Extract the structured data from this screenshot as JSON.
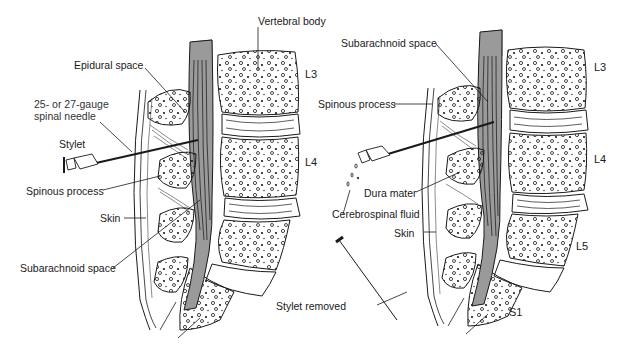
{
  "figure": {
    "left_panel": {
      "labels": {
        "vertebral_body": "Vertebral body",
        "epidural_space": "Epidural space",
        "needle_line1": "25- or 27-gauge",
        "needle_line2": "spinal needle",
        "stylet": "Stylet",
        "spinous_process": "Spinous process",
        "skin": "Skin",
        "subarachnoid_space": "Subarachnoid space"
      },
      "levels": [
        "L3",
        "L4"
      ]
    },
    "right_panel": {
      "labels": {
        "subarachnoid_space": "Subarachnoid space",
        "spinous_process": "Spinous process",
        "dura_mater": "Dura mater",
        "cerebrospinal_fluid": "Cerebrospinal fluid",
        "skin": "Skin",
        "stylet_removed": "Stylet removed"
      },
      "levels": [
        "L3",
        "L4",
        "L5",
        "S1"
      ]
    },
    "colors": {
      "line": "#1a1a1a",
      "cord_fill": "#8a8a8a",
      "cap_fill": "#bdbdbd",
      "background": "#ffffff"
    }
  }
}
